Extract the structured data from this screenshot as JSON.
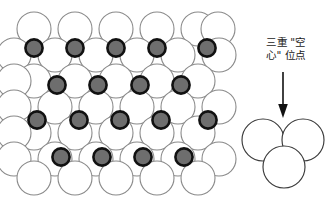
{
  "figure": {
    "background_color": "#ffffff"
  },
  "annotation": {
    "name": "triple-hollow-site-label",
    "line1": "三重 \"空",
    "line2": "心\" 位点",
    "full_text": "三重\"空心\"位点",
    "text_color": "#1a1a1a",
    "font_size_px": 10.5
  },
  "arrow": {
    "name": "down-arrow",
    "direction": "down",
    "color": "#111111",
    "x": 283,
    "y_start": 72,
    "y_end": 116
  },
  "colors": {
    "substrate_atom_fill": "#ffffff",
    "substrate_atom_stroke": "#8a8a8a",
    "adatom_fill": "#6e6e6e",
    "adatom_stroke": "#111111",
    "detail_circle_fill": "#ffffff",
    "detail_circle_stroke": "#3a3a3a"
  },
  "lattice": {
    "name": "close-packed-surface-lattice",
    "description": "Hexagonal close-packed array of open substrate spheres with dark adatoms occupying three-fold hollow sites",
    "substrate_rows": 7,
    "substrate_columns_long": 6,
    "substrate_columns_short": 5,
    "substrate_radius_px": 17,
    "adatom_radius_px": 9,
    "adatom_rows": [
      {
        "row_index": 1,
        "count": 5
      },
      {
        "row_index": 2,
        "count": 4
      },
      {
        "row_index": 3,
        "count": 5
      },
      {
        "row_index": 4,
        "count": 4
      }
    ],
    "adatom_total": 18,
    "geometry": {
      "origin_x": 34,
      "origin_y": 29,
      "dx": 41,
      "dy": 26
    }
  },
  "detail_cluster": {
    "name": "three-fold-hollow-detail",
    "circle_count": 3,
    "circles": [
      {
        "cx": 263,
        "cy": 140,
        "r": 21
      },
      {
        "cx": 303,
        "cy": 140,
        "r": 21
      },
      {
        "cx": 284,
        "cy": 167,
        "r": 21
      }
    ]
  }
}
